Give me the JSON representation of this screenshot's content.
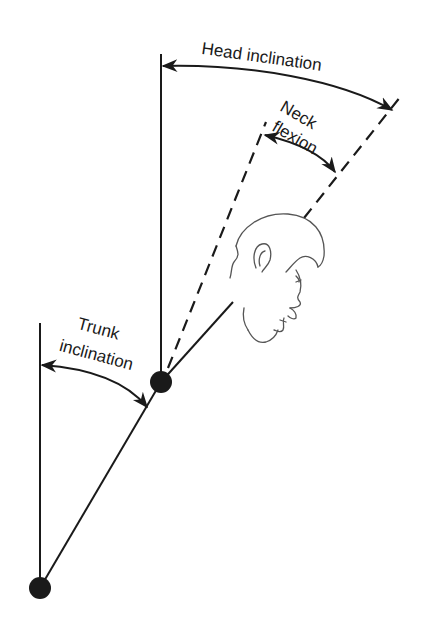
{
  "diagram": {
    "title": "",
    "labels": {
      "head_inclination": "Head inclination",
      "neck_flexion_line1": "Neck",
      "neck_flexion_line2": "flexion",
      "trunk_inclination_line1": "Trunk",
      "trunk_inclination_line2": "inclination"
    },
    "nodes": [
      {
        "id": "hip-joint",
        "x": 40,
        "y": 588,
        "r": 11
      },
      {
        "id": "neck-joint",
        "x": 161,
        "y": 382,
        "r": 11
      }
    ],
    "colors": {
      "line": "#1a1a1a",
      "head_outline": "#555555",
      "background": "#ffffff"
    }
  }
}
